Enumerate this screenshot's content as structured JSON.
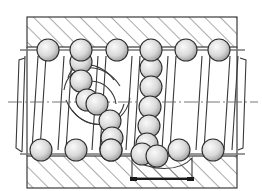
{
  "diagram": {
    "width": 262,
    "height": 191,
    "colors": {
      "line": "#3a3a3a",
      "hatch": "#555555",
      "ball_light": "#f4f4f4",
      "ball_dark": "#9a9a9a",
      "background": "#ffffff",
      "bar": "#1a1a1a"
    },
    "nut": {
      "x": 27,
      "y": 17,
      "w": 210,
      "h": 155,
      "top_band": {
        "y": 17,
        "h": 33
      },
      "bottom_band": {
        "y": 158,
        "h": 30
      }
    },
    "top_balls": [
      {
        "cx": 48,
        "cy": 50
      },
      {
        "cx": 81,
        "cy": 50
      },
      {
        "cx": 117,
        "cy": 50
      },
      {
        "cx": 151,
        "cy": 50
      },
      {
        "cx": 186,
        "cy": 50
      },
      {
        "cx": 219,
        "cy": 50
      }
    ],
    "bottom_balls": [
      {
        "cx": 41,
        "cy": 150
      },
      {
        "cx": 76,
        "cy": 150
      },
      {
        "cx": 111,
        "cy": 150
      },
      {
        "cx": 179,
        "cy": 150
      },
      {
        "cx": 213,
        "cy": 150
      }
    ],
    "return_left_balls": [
      {
        "cx": 81,
        "cy": 62
      },
      {
        "cx": 81,
        "cy": 81
      },
      {
        "cx": 87,
        "cy": 100
      },
      {
        "cx": 97,
        "cy": 104
      },
      {
        "cx": 110,
        "cy": 121
      },
      {
        "cx": 112,
        "cy": 138
      },
      {
        "cx": 111,
        "cy": 150
      }
    ],
    "return_right_balls": [
      {
        "cx": 151,
        "cy": 68
      },
      {
        "cx": 151,
        "cy": 87
      },
      {
        "cx": 150,
        "cy": 107
      },
      {
        "cx": 149,
        "cy": 126
      },
      {
        "cx": 147,
        "cy": 144
      },
      {
        "cx": 142,
        "cy": 154
      },
      {
        "cx": 157,
        "cy": 156
      }
    ],
    "ball_radius": 11,
    "centerline_y": 102,
    "dimension_bar": {
      "x1": 132,
      "x2": 192,
      "y": 179
    },
    "labels": {
      "nut_label": "Nut (hatched section)",
      "screw_label": "Screw shaft",
      "balls_label": "Recirculating balls",
      "return_label": "Return channel"
    }
  }
}
